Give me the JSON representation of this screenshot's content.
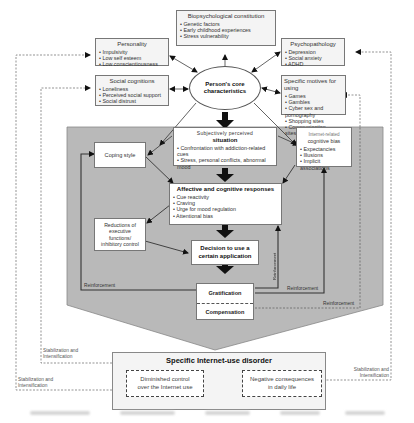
{
  "diagram": {
    "core": {
      "label_line1": "Person's core",
      "label_line2": "characteristics"
    },
    "biopsych": {
      "title": "Biopsychological constitution",
      "items": [
        "Genetic factors",
        "Early childhood experiences",
        "Stress vulnerability"
      ]
    },
    "personality": {
      "title": "Personality",
      "items": [
        "Impulsivity",
        "Low self esteem",
        "Low conscientiousness"
      ]
    },
    "social": {
      "title": "Social cognitions",
      "items": [
        "Loneliness",
        "Perceived social support",
        "Social distrust"
      ]
    },
    "psychopathology": {
      "title": "Psychopathology",
      "items": [
        "Depression",
        "Social anxiety",
        "ADHD"
      ]
    },
    "motives": {
      "title": "Specific motives for using",
      "items": [
        "Games",
        "Gambles",
        "Cyber sex and pornography",
        "Shopping sites",
        "Communication sites/apps"
      ]
    },
    "situation": {
      "title_line1": "Subjectively perceived",
      "title_line2": "situation",
      "items": [
        "Confrontation with addiction-related cues",
        "Stress, personal conflicts, abnormal mood"
      ]
    },
    "coping": {
      "label": "Coping style"
    },
    "bias": {
      "title_line1": "Internet-related",
      "title_line2": "cognitive bias",
      "items": [
        "Expectancies",
        "Illusions",
        "Implicit associations"
      ]
    },
    "affective": {
      "title": "Affective and cognitive responses",
      "items": [
        "Cue reactivity",
        "Craving",
        "Urge for mood regulation",
        "Attentional bias"
      ]
    },
    "executive": {
      "line1": "Reductions of",
      "line2": "executive",
      "line3": "functions/",
      "line4": "inhibitory control"
    },
    "decision": {
      "line1": "Decision to use a",
      "line2": "certain application"
    },
    "gratification": {
      "label": "Gratification"
    },
    "compensation": {
      "label": "Compensation"
    },
    "reinforcement_labels": {
      "left": "Reinforcement",
      "vertical": "Reinforcement",
      "right_inner": "Reinforcement",
      "right_outer": "Reinforcement"
    },
    "stabilization": {
      "inner_left_line1": "Stabilization and",
      "inner_left_line2": "Intensification",
      "outer_left_line1": "Stabilization and",
      "outer_left_line2": "Intensification",
      "right_line1": "Stabilization and",
      "right_line2": "Intensification"
    },
    "disorder": {
      "title": "Specific Internet-use disorder",
      "left_line1": "Diminished control",
      "left_line2": "over the Internet use",
      "right_line1": "Negative consequences",
      "right_line2": "in daily life"
    }
  },
  "colors": {
    "process_area": "#b9b9b9",
    "box_border": "#777777",
    "arrow": "#111111",
    "dashed": "#666666"
  }
}
